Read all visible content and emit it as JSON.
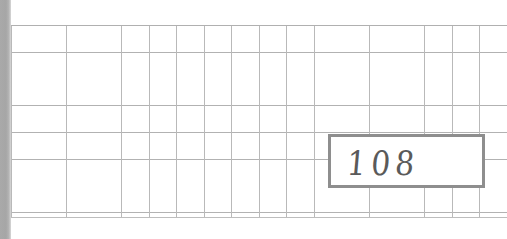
{
  "page": {
    "kind": "scanned-grid-paper",
    "width": 507,
    "height": 239,
    "background_color": "#ffffff"
  },
  "page_edge": {
    "name": "left-scan-shadow",
    "color": "#a9a9a9",
    "width_px": 11
  },
  "grid": {
    "line_color_vertical": "#b9b9b9",
    "line_color_horizontal": "#b2b2b2",
    "cell_width_px": 27.5,
    "cell_height_px": 26.7,
    "columns": 18,
    "rows": 8,
    "origin_x_px": 11,
    "origin_y_px": 25,
    "end_y_px": 217
  },
  "answer_box": {
    "label": "handwritten-answer-box",
    "border_color": "#8e8e8e",
    "border_width_px": 3,
    "fill_color": "#ffffff",
    "x_px": 328,
    "y_px": 134,
    "width_px": 157,
    "height_px": 54,
    "value": "108",
    "ink_color": "#5a5a5a",
    "writing_style": "handwritten-pencil"
  }
}
